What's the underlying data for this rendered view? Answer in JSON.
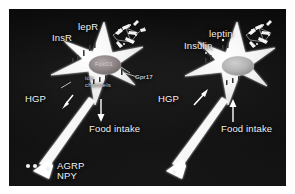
{
  "figure": {
    "panels": [
      {
        "id": "left",
        "name": "left-panel",
        "receptor_labels": [
          "lepR",
          "InsR"
        ],
        "nucleus_label": "FoxO1",
        "membrane_label": "ion\nchannels",
        "gpcr_label": "Gpr17",
        "output_labels": [
          "HGP",
          "Food intake"
        ],
        "neuropeptide_label": "AGRP\nNPY",
        "hgp_arrow_direction": "down",
        "food_intake_arrow_direction": "down"
      },
      {
        "id": "right",
        "name": "right-panel",
        "ligand_labels": [
          "leptin",
          "Insulin"
        ],
        "output_labels": [
          "HGP",
          "Food intake"
        ],
        "hgp_arrow_direction": "up",
        "food_intake_arrow_direction": "up"
      }
    ],
    "labels": {
      "lepR": "lepR",
      "InsR": "InsR",
      "FoxO1": "FoxO1",
      "ion_channels": "ion\nchannels",
      "Gpr17": "Gpr17",
      "HGP_left": "HGP",
      "food_intake_left": "Food intake",
      "AGRP_NPY": "AGRP\nNPY",
      "leptin": "leptin",
      "Insulin": "Insulin",
      "HGP_right": "HGP",
      "food_intake_right": "Food intake"
    },
    "colors": {
      "background": "#ffffff",
      "canvas": "#080808",
      "cell": "#f5f5f5",
      "nucleus": "#8a8a8a",
      "label_text": "#f2f2f2",
      "arrow": "#ffffff"
    }
  }
}
